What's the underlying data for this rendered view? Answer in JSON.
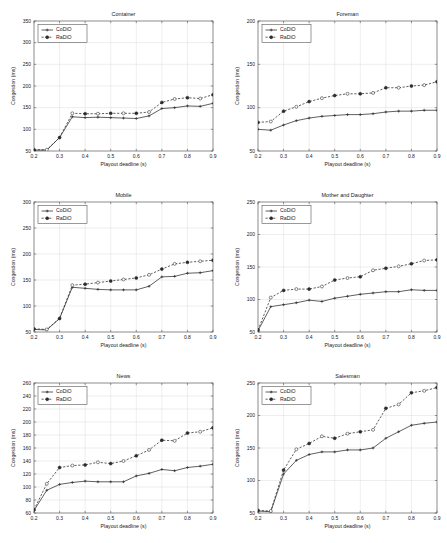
{
  "figure": {
    "panel_order": [
      "container",
      "foreman",
      "mobile",
      "mother_and_daughter",
      "news",
      "salesman"
    ]
  },
  "legend": {
    "codio_label": "CoDiO",
    "radio_label": "RaDiO"
  },
  "axes": {
    "xlabel": "Playout deadline (s)",
    "ylabel": "Congestion (ms)",
    "xticks": [
      "0.2",
      "0.3",
      "0.4",
      "0.5",
      "0.6",
      "0.7",
      "0.8",
      "0.9"
    ],
    "xlim": [
      0.2,
      0.9
    ]
  },
  "colors": {
    "line": "#2b2b2b",
    "grid": "#d8d8d8",
    "frame": "#555555",
    "background": "#ffffff"
  },
  "chart_data": [
    {
      "type": "line",
      "id": "container",
      "title": "Container",
      "xlabel": "Playout deadline (s)",
      "ylabel": "Congestion (ms)",
      "xlim": [
        0.2,
        0.9
      ],
      "ylim": [
        50,
        350
      ],
      "yticks": [
        50,
        100,
        150,
        200,
        250,
        300,
        350
      ],
      "xticks": [
        0.2,
        0.3,
        0.4,
        0.5,
        0.6,
        0.7,
        0.8,
        0.9
      ],
      "grid": true,
      "legend_position": "upper left",
      "x": [
        0.2,
        0.25,
        0.3,
        0.35,
        0.4,
        0.45,
        0.5,
        0.55,
        0.6,
        0.65,
        0.7,
        0.75,
        0.8,
        0.85,
        0.9
      ],
      "series": [
        {
          "name": "CoDiO",
          "values": [
            52,
            52,
            81,
            129,
            127,
            128,
            127,
            126,
            125,
            131,
            148,
            150,
            154,
            153,
            160
          ]
        },
        {
          "name": "RaDiO",
          "values": [
            53,
            53,
            81,
            137,
            136,
            136,
            137,
            137,
            137,
            140,
            162,
            170,
            173,
            171,
            180
          ]
        }
      ]
    },
    {
      "type": "line",
      "id": "foreman",
      "title": "Foreman",
      "xlabel": "Playout deadline (s)",
      "ylabel": "Congestion (ms)",
      "xlim": [
        0.2,
        0.9
      ],
      "ylim": [
        50,
        200
      ],
      "yticks": [
        50,
        100,
        150,
        200
      ],
      "xticks": [
        0.2,
        0.3,
        0.4,
        0.5,
        0.6,
        0.7,
        0.8,
        0.9
      ],
      "grid": true,
      "legend_position": "upper left",
      "x": [
        0.2,
        0.25,
        0.3,
        0.35,
        0.4,
        0.45,
        0.5,
        0.55,
        0.6,
        0.65,
        0.7,
        0.75,
        0.8,
        0.85,
        0.9
      ],
      "series": [
        {
          "name": "CoDiO",
          "values": [
            75,
            74,
            80,
            85,
            88,
            90,
            91,
            92,
            92,
            93,
            95,
            96,
            96,
            97,
            97
          ]
        },
        {
          "name": "RaDiO",
          "values": [
            83,
            84,
            96,
            101,
            107,
            111,
            114,
            116,
            116,
            117,
            123,
            123,
            125,
            126,
            130
          ]
        }
      ]
    },
    {
      "type": "line",
      "id": "mobile",
      "title": "Mobile",
      "xlabel": "Playout deadline (s)",
      "ylabel": "Congestion (ms)",
      "xlim": [
        0.2,
        0.9
      ],
      "ylim": [
        50,
        300
      ],
      "yticks": [
        50,
        100,
        150,
        200,
        250,
        300
      ],
      "xticks": [
        0.2,
        0.3,
        0.4,
        0.5,
        0.6,
        0.7,
        0.8,
        0.9
      ],
      "grid": true,
      "legend_position": "upper left",
      "x": [
        0.2,
        0.25,
        0.3,
        0.35,
        0.4,
        0.45,
        0.5,
        0.55,
        0.6,
        0.65,
        0.7,
        0.75,
        0.8,
        0.85,
        0.9
      ],
      "series": [
        {
          "name": "CoDiO",
          "values": [
            55,
            54,
            76,
            136,
            134,
            132,
            131,
            131,
            131,
            138,
            156,
            157,
            163,
            164,
            168
          ]
        },
        {
          "name": "RaDiO",
          "values": [
            56,
            55,
            76,
            140,
            142,
            145,
            148,
            151,
            154,
            160,
            171,
            181,
            184,
            186,
            188
          ]
        }
      ]
    },
    {
      "type": "line",
      "id": "mother_and_daughter",
      "title": "Mother and Daughter",
      "xlabel": "Playout deadline (s)",
      "ylabel": "Congestion (ms)",
      "xlim": [
        0.2,
        0.9
      ],
      "ylim": [
        50,
        250
      ],
      "yticks": [
        50,
        100,
        150,
        200,
        250
      ],
      "xticks": [
        0.2,
        0.3,
        0.4,
        0.5,
        0.6,
        0.7,
        0.8,
        0.9
      ],
      "grid": true,
      "legend_position": "upper left",
      "x": [
        0.2,
        0.25,
        0.3,
        0.35,
        0.4,
        0.45,
        0.5,
        0.55,
        0.6,
        0.65,
        0.7,
        0.75,
        0.8,
        0.85,
        0.9
      ],
      "series": [
        {
          "name": "CoDiO",
          "values": [
            52,
            89,
            92,
            95,
            99,
            97,
            102,
            105,
            108,
            110,
            112,
            112,
            115,
            114,
            114
          ]
        },
        {
          "name": "RaDiO",
          "values": [
            53,
            103,
            114,
            116,
            116,
            120,
            130,
            133,
            135,
            145,
            148,
            151,
            155,
            160,
            161
          ]
        }
      ]
    },
    {
      "type": "line",
      "id": "news",
      "title": "News",
      "xlabel": "Playout deadline (s)",
      "ylabel": "Congestion (ms)",
      "xlim": [
        0.2,
        0.9
      ],
      "ylim": [
        60,
        260
      ],
      "yticks": [
        60,
        80,
        100,
        120,
        140,
        160,
        180,
        200,
        220,
        240,
        260
      ],
      "xticks": [
        0.2,
        0.3,
        0.4,
        0.5,
        0.6,
        0.7,
        0.8,
        0.9
      ],
      "grid": true,
      "legend_position": "upper left",
      "x": [
        0.2,
        0.25,
        0.3,
        0.35,
        0.4,
        0.45,
        0.5,
        0.55,
        0.6,
        0.65,
        0.7,
        0.75,
        0.8,
        0.85,
        0.9
      ],
      "series": [
        {
          "name": "CoDiO",
          "values": [
            64,
            95,
            104,
            107,
            109,
            108,
            108,
            108,
            117,
            121,
            127,
            125,
            130,
            132,
            135
          ]
        },
        {
          "name": "RaDiO",
          "values": [
            65,
            105,
            130,
            133,
            134,
            138,
            136,
            140,
            148,
            157,
            172,
            171,
            183,
            185,
            191
          ]
        }
      ]
    },
    {
      "type": "line",
      "id": "salesman",
      "title": "Salesman",
      "xlabel": "Playout deadline (s)",
      "ylabel": "Congestion (ms)",
      "xlim": [
        0.2,
        0.9
      ],
      "ylim": [
        50,
        250
      ],
      "yticks": [
        50,
        100,
        150,
        200,
        250
      ],
      "xticks": [
        0.2,
        0.3,
        0.4,
        0.5,
        0.6,
        0.7,
        0.8,
        0.9
      ],
      "grid": true,
      "legend_position": "upper left",
      "x": [
        0.2,
        0.25,
        0.3,
        0.35,
        0.4,
        0.45,
        0.5,
        0.55,
        0.6,
        0.65,
        0.7,
        0.75,
        0.8,
        0.85,
        0.9
      ],
      "series": [
        {
          "name": "CoDiO",
          "values": [
            53,
            52,
            110,
            131,
            140,
            144,
            144,
            147,
            147,
            150,
            165,
            175,
            185,
            188,
            190
          ]
        },
        {
          "name": "RaDiO",
          "values": [
            54,
            53,
            116,
            148,
            157,
            168,
            165,
            172,
            175,
            178,
            211,
            217,
            235,
            238,
            243
          ]
        }
      ]
    }
  ]
}
